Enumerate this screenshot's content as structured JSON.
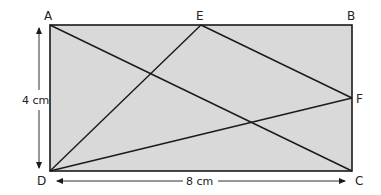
{
  "diagram": {
    "colors": {
      "fill": "#d9d9d9",
      "stroke": "#1a1a1a",
      "text": "#222222",
      "background": "#ffffff"
    },
    "vertices": {
      "A": {
        "label": "A",
        "x": 50,
        "y": 25
      },
      "B": {
        "label": "B",
        "x": 352,
        "y": 25
      },
      "C": {
        "label": "C",
        "x": 352,
        "y": 171
      },
      "D": {
        "label": "D",
        "x": 50,
        "y": 171
      },
      "E": {
        "label": "E",
        "x": 201,
        "y": 25
      },
      "F": {
        "label": "F",
        "x": 352,
        "y": 98
      }
    },
    "segments": [
      {
        "from": "A",
        "to": "C"
      },
      {
        "from": "D",
        "to": "E"
      },
      {
        "from": "E",
        "to": "F"
      },
      {
        "from": "D",
        "to": "F"
      }
    ],
    "dimensions": {
      "height": {
        "label": "4 cm",
        "value": 4,
        "unit": "cm"
      },
      "width": {
        "label": "8 cm",
        "value": 8,
        "unit": "cm"
      }
    }
  }
}
